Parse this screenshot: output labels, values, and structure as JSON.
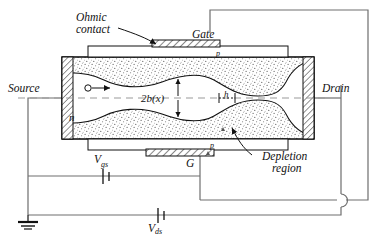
{
  "figure": {
    "type": "jfet-cross-section-schematic",
    "style": "line-drawing"
  },
  "labels": {
    "ohmic_contact": "Ohmic",
    "ohmic_contact2": "contact",
    "gate": "Gate",
    "source": "Source",
    "drain": "Drain",
    "channel_type": "n",
    "gate_type_top": "p",
    "gate_type_bottom": "p",
    "channel_width": "2b(x)",
    "channel_half": "h",
    "gate_terminal": "G",
    "depletion": "Depletion",
    "depletion2": "region",
    "vgs": "V",
    "vgs_sub": "gs",
    "vds": "V",
    "vds_sub": "ds"
  },
  "annotations": {
    "carrier_arrow": "electron-flow-arrow",
    "ground": "ground-symbol",
    "wire_hop": "wire-crossover-hop"
  },
  "colors": {
    "ink": "#111111",
    "dash": "#8a8a8a",
    "wire": "#6e6e6e",
    "stipple": "#5a5a5a",
    "paper": "#ffffff"
  },
  "geometry": {
    "body_left": 62,
    "body_right": 314,
    "body_top": 57,
    "body_bottom": 139,
    "axis_y": 98
  }
}
